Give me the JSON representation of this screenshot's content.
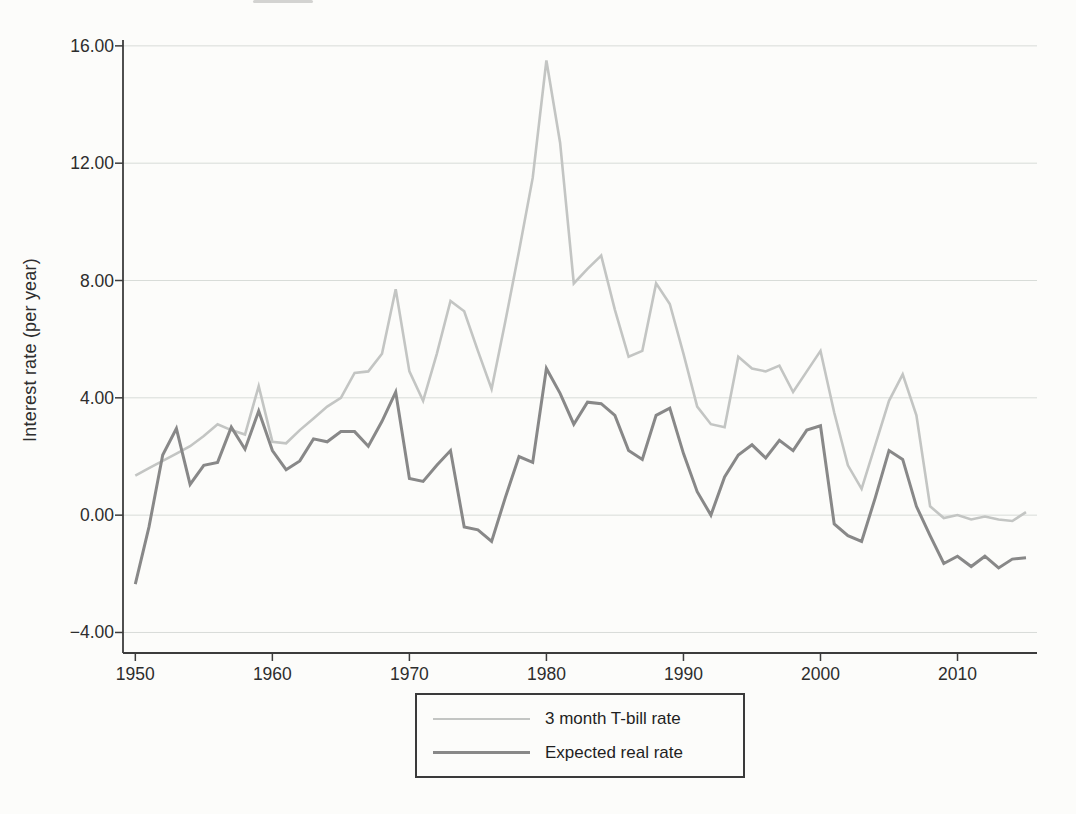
{
  "figure": {
    "y_axis": {
      "title": "Interest rate (per year)",
      "tick_labels": [
        "16.00",
        "12.00",
        "8.00",
        "4.00",
        "0.00",
        "−4.00"
      ],
      "tick_values": [
        16,
        12,
        8,
        4,
        0,
        -4
      ]
    },
    "x_axis": {
      "tick_labels": [
        "1950",
        "1960",
        "1970",
        "1980",
        "1990",
        "2000",
        "2010"
      ],
      "tick_values": [
        1950,
        1960,
        1970,
        1980,
        1990,
        2000,
        2010
      ]
    },
    "colors": {
      "background": "#fcfcfa",
      "axis": "#3c3c3c",
      "gridline": "#d8dcd8",
      "tick_text": "#2d2d2d",
      "tbill_line": "#c3c5c3",
      "real_rate_line": "#888888"
    }
  },
  "chart_data": {
    "type": "line",
    "title": "",
    "xlabel": "",
    "ylabel": "Interest rate (per year)",
    "grid": true,
    "legend_position": "bottom-center",
    "xlim": [
      1949.1,
      2015.8
    ],
    "ylim": [
      -4.7,
      16.2
    ],
    "x": [
      1950,
      1951,
      1952,
      1953,
      1954,
      1955,
      1956,
      1957,
      1958,
      1959,
      1960,
      1961,
      1962,
      1963,
      1964,
      1965,
      1966,
      1967,
      1968,
      1969,
      1970,
      1971,
      1972,
      1973,
      1974,
      1975,
      1976,
      1977,
      1978,
      1979,
      1980,
      1981,
      1982,
      1983,
      1984,
      1985,
      1986,
      1987,
      1988,
      1989,
      1990,
      1991,
      1992,
      1993,
      1994,
      1995,
      1996,
      1997,
      1998,
      1999,
      2000,
      2001,
      2002,
      2003,
      2004,
      2005,
      2006,
      2007,
      2008,
      2009,
      2010,
      2011,
      2012,
      2013,
      2014,
      2015
    ],
    "series": [
      {
        "name": "3 month T-bill rate",
        "color": "#c3c5c3",
        "stroke_width": 2.6,
        "values": [
          1.35,
          1.6,
          1.85,
          2.1,
          2.35,
          2.7,
          3.1,
          2.9,
          2.75,
          4.4,
          2.5,
          2.45,
          2.9,
          3.3,
          3.7,
          4.0,
          4.85,
          4.9,
          5.5,
          7.7,
          4.9,
          3.9,
          5.5,
          7.3,
          6.95,
          5.6,
          4.3,
          6.6,
          9.0,
          11.5,
          15.5,
          12.7,
          7.9,
          8.4,
          8.85,
          7.0,
          5.4,
          5.6,
          7.9,
          7.2,
          5.5,
          3.7,
          3.1,
          3.0,
          5.4,
          5.0,
          4.9,
          5.1,
          4.2,
          4.9,
          5.6,
          3.5,
          1.7,
          0.9,
          2.4,
          3.9,
          4.8,
          3.4,
          0.3,
          -0.1,
          0.0,
          -0.15,
          -0.05,
          -0.15,
          -0.2,
          0.1
        ]
      },
      {
        "name": "Expected real rate",
        "color": "#888888",
        "stroke_width": 3,
        "values": [
          -2.35,
          -0.4,
          2.05,
          2.95,
          1.05,
          1.7,
          1.8,
          3.0,
          2.25,
          3.55,
          2.2,
          1.55,
          1.85,
          2.6,
          2.5,
          2.85,
          2.85,
          2.35,
          3.2,
          4.2,
          1.25,
          1.15,
          1.7,
          2.2,
          -0.4,
          -0.5,
          -0.9,
          0.6,
          2.0,
          1.8,
          5.0,
          4.15,
          3.1,
          3.85,
          3.8,
          3.4,
          2.2,
          1.9,
          3.4,
          3.65,
          2.1,
          0.8,
          0.0,
          1.3,
          2.05,
          2.4,
          1.95,
          2.55,
          2.2,
          2.9,
          3.05,
          -0.3,
          -0.7,
          -0.9,
          0.6,
          2.2,
          1.9,
          0.3,
          -0.7,
          -1.65,
          -1.4,
          -1.75,
          -1.4,
          -1.8,
          -1.5,
          -1.45
        ]
      }
    ]
  }
}
